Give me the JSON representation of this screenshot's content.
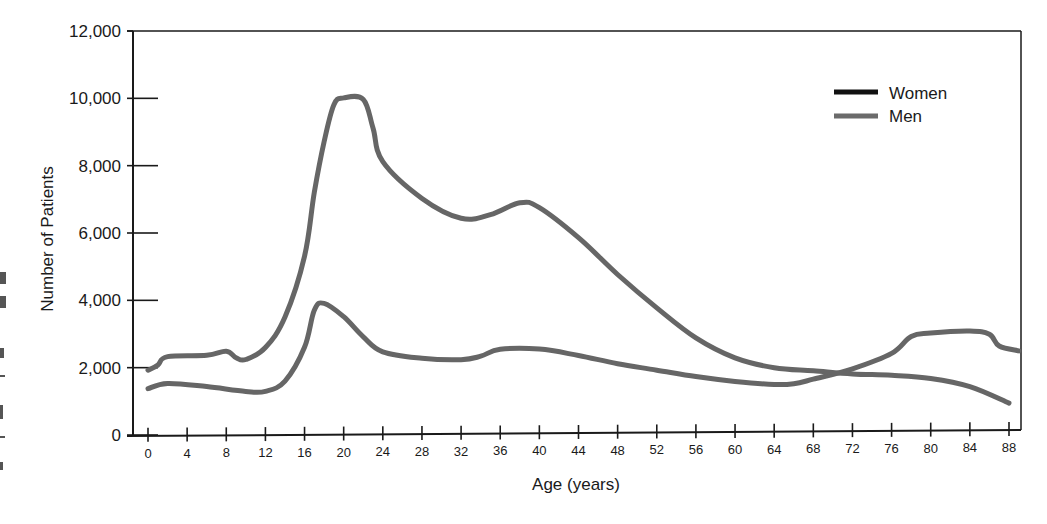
{
  "chart_data": {
    "type": "line",
    "title": "",
    "xlabel": "Age (years)",
    "ylabel": "Number of Patients",
    "xlim": [
      0,
      89
    ],
    "ylim": [
      0,
      12000
    ],
    "grid": false,
    "legend_position": "upper right",
    "x_ticks": [
      0,
      4,
      8,
      12,
      16,
      20,
      24,
      28,
      32,
      36,
      40,
      44,
      48,
      52,
      56,
      60,
      64,
      68,
      72,
      76,
      80,
      84,
      88
    ],
    "y_ticks": [
      0,
      2000,
      4000,
      6000,
      8000,
      10000,
      12000
    ],
    "y_tick_labels": [
      "0",
      "2,000",
      "4,000",
      "6,000",
      "8,000",
      "10,000",
      "12,000"
    ],
    "series": [
      {
        "name": "Women",
        "legend_color": "#111111",
        "line_color": "#666666",
        "x": [
          0,
          2,
          6,
          10,
          12,
          14,
          16,
          17,
          18,
          20,
          22,
          24,
          28,
          32,
          34,
          36,
          40,
          44,
          48,
          52,
          56,
          60,
          64,
          66,
          68,
          72,
          76,
          78,
          80,
          84,
          86,
          87,
          89
        ],
        "values": [
          1400,
          1550,
          1450,
          1300,
          1300,
          1600,
          2600,
          3700,
          3900,
          3500,
          2900,
          2450,
          2250,
          2200,
          2300,
          2500,
          2500,
          2300,
          2050,
          1850,
          1650,
          1500,
          1400,
          1420,
          1550,
          1850,
          2300,
          2800,
          2900,
          2950,
          2850,
          2500,
          2350
        ]
      },
      {
        "name": "Men",
        "legend_color": "#6b6b6b",
        "line_color": "#666666",
        "x": [
          0,
          1,
          2,
          6,
          8,
          9,
          10,
          12,
          14,
          16,
          17,
          18,
          19,
          20,
          22,
          23,
          24,
          28,
          32,
          35,
          38,
          40,
          44,
          48,
          52,
          56,
          60,
          64,
          68,
          72,
          76,
          80,
          84,
          88
        ],
        "values": [
          1950,
          2100,
          2350,
          2380,
          2500,
          2300,
          2250,
          2600,
          3500,
          5300,
          7200,
          8700,
          9800,
          10000,
          9950,
          9100,
          8100,
          7000,
          6400,
          6500,
          6850,
          6700,
          5800,
          4700,
          3700,
          2800,
          2200,
          1900,
          1800,
          1700,
          1650,
          1550,
          1300,
          800
        ]
      }
    ]
  },
  "legend": {
    "items": [
      {
        "label": "Women",
        "color": "#111111"
      },
      {
        "label": "Men",
        "color": "#6b6b6b"
      }
    ]
  }
}
